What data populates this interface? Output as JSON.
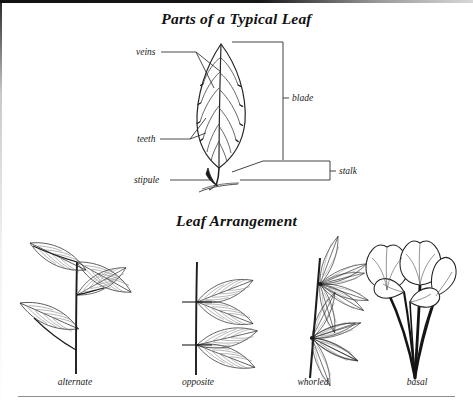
{
  "page": {
    "figure_kind": "botanical-illustration",
    "background_color": "#ffffff",
    "ink_color": "#222222",
    "rule_color": "#8d8d8d"
  },
  "sections": {
    "parts": {
      "title": "Parts of a Typical Leaf",
      "labels": {
        "veins": "veins",
        "teeth": "teeth",
        "stipule": "stipule",
        "blade": "blade",
        "stalk": "stalk"
      }
    },
    "arrangement": {
      "title": "Leaf Arrangement",
      "items": [
        {
          "label": "alternate"
        },
        {
          "label": "opposite"
        },
        {
          "label": "whorled"
        },
        {
          "label": "basal"
        }
      ]
    }
  }
}
